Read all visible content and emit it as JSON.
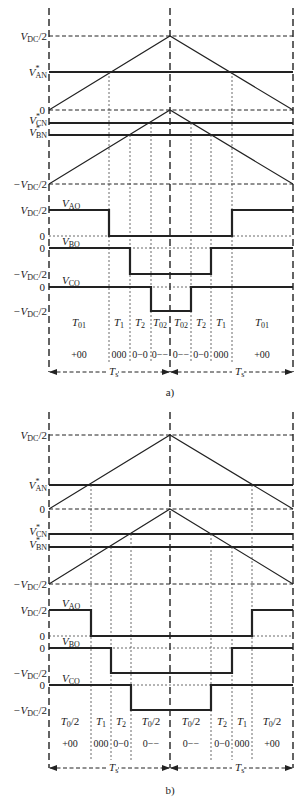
{
  "figure": {
    "panels": [
      {
        "caption": "a)",
        "axis_labels": {
          "vdc_half": "V",
          "vdc_half_sub": "DC",
          "vdc_half_suffix": "/2",
          "van": "V",
          "van_sub": "AN",
          "zero": "0",
          "vcn": "V",
          "vcn_sub": "CN",
          "vbn": "V",
          "vbn_sub": "BN",
          "neg_vdc_half": "−V",
          "neg_vdc_half_sub": "DC",
          "neg_vdc_half_suffix": "/2"
        },
        "signal_labels": {
          "vao": "V",
          "vao_sub": "AO",
          "vbo": "V",
          "vbo_sub": "BO",
          "vco": "V",
          "vco_sub": "CO"
        },
        "interval_labels": [
          {
            "main": "T",
            "sub": "01"
          },
          {
            "main": "T",
            "sub": "1"
          },
          {
            "main": "T",
            "sub": "2"
          },
          {
            "main": "T",
            "sub": "02"
          },
          {
            "main": "T",
            "sub": "02"
          },
          {
            "main": "T",
            "sub": "2"
          },
          {
            "main": "T",
            "sub": "1"
          },
          {
            "main": "T",
            "sub": "01"
          }
        ],
        "states": [
          "+00",
          "000",
          "0−0",
          "0−−",
          "0−−",
          "0−0",
          "000",
          "+00"
        ],
        "period_label": {
          "main": "T",
          "sub": "s"
        }
      },
      {
        "caption": "b)",
        "axis_labels": {
          "vdc_half": "V",
          "vdc_half_sub": "DC",
          "vdc_half_suffix": "/2",
          "van": "V",
          "van_sub": "AN",
          "zero": "0",
          "vcn": "V",
          "vcn_sub": "CN",
          "vbn": "V",
          "vbn_sub": "BN",
          "neg_vdc_half": "−V",
          "neg_vdc_half_sub": "DC",
          "neg_vdc_half_suffix": "/2"
        },
        "signal_labels": {
          "vao": "V",
          "vao_sub": "AO",
          "vbo": "V",
          "vbo_sub": "BO",
          "vco": "V",
          "vco_sub": "CO"
        },
        "interval_labels": [
          {
            "main": "T",
            "sub": "0",
            "suffix": "/2"
          },
          {
            "main": "T",
            "sub": "1",
            "suffix": ""
          },
          {
            "main": "T",
            "sub": "2",
            "suffix": ""
          },
          {
            "main": "T",
            "sub": "0",
            "suffix": "/2"
          },
          {
            "main": "T",
            "sub": "0",
            "suffix": "/2"
          },
          {
            "main": "T",
            "sub": "2",
            "suffix": ""
          },
          {
            "main": "T",
            "sub": "1",
            "suffix": ""
          },
          {
            "main": "T",
            "sub": "0",
            "suffix": "/2"
          }
        ],
        "states": [
          "+00",
          "000",
          "0−0",
          "0−−",
          "0−−",
          "0−0",
          "000",
          "+00"
        ],
        "period_label": {
          "main": "T",
          "sub": "s"
        }
      }
    ],
    "star": "*"
  }
}
